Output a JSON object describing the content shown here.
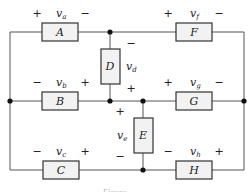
{
  "diagram": {
    "type": "circuit",
    "colors": {
      "wire": "#555555",
      "box_fill": "#f2f2f2",
      "box_stroke": "#333333",
      "node": "#111111"
    },
    "elements": [
      {
        "id": "A",
        "label": "A",
        "voltage": "v",
        "sub": "a",
        "left_sign": "+",
        "right_sign": "−"
      },
      {
        "id": "B",
        "label": "B",
        "voltage": "v",
        "sub": "b",
        "left_sign": "−",
        "right_sign": "+"
      },
      {
        "id": "C",
        "label": "C",
        "voltage": "v",
        "sub": "c",
        "left_sign": "−",
        "right_sign": "+"
      },
      {
        "id": "D",
        "label": "D",
        "voltage": "v",
        "sub": "d",
        "top_sign": "−",
        "bottom_sign": "+"
      },
      {
        "id": "E",
        "label": "E",
        "voltage": "v",
        "sub": "e",
        "top_sign": "+",
        "bottom_sign": "−"
      },
      {
        "id": "F",
        "label": "F",
        "voltage": "v",
        "sub": "f",
        "left_sign": "+",
        "right_sign": "−"
      },
      {
        "id": "G",
        "label": "G",
        "voltage": "v",
        "sub": "g",
        "left_sign": "+",
        "right_sign": "−"
      },
      {
        "id": "H",
        "label": "H",
        "voltage": "v",
        "sub": "h",
        "left_sign": "−",
        "right_sign": "+"
      }
    ],
    "caption": "Figure"
  }
}
